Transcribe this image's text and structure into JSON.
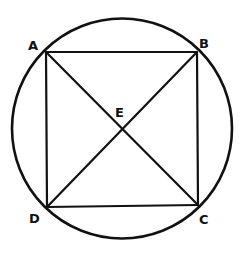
{
  "diagram": {
    "stroke_color": "#111111",
    "background": "#ffffff",
    "circle": {
      "cx": 122,
      "cy": 128.5,
      "r": 110
    },
    "points": {
      "A": {
        "x": 46,
        "y": 52
      },
      "B": {
        "x": 197,
        "y": 52
      },
      "C": {
        "x": 198,
        "y": 205
      },
      "D": {
        "x": 47,
        "y": 207
      },
      "E": {
        "x": 122,
        "y": 129
      }
    },
    "labels": {
      "A": "A",
      "B": "B",
      "C": "C",
      "D": "D",
      "E": "E"
    },
    "segments": [
      [
        "A",
        "B"
      ],
      [
        "B",
        "C"
      ],
      [
        "C",
        "D"
      ],
      [
        "D",
        "A"
      ],
      [
        "A",
        "C"
      ],
      [
        "B",
        "D"
      ]
    ]
  }
}
